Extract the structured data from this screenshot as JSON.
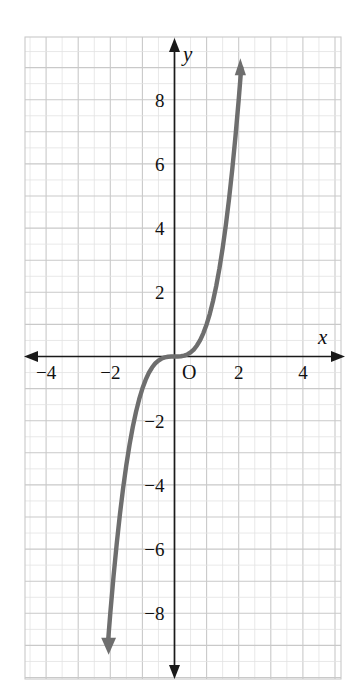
{
  "figure": {
    "background_color": "#ffffff",
    "grid_color": "#c9c9c9",
    "grid_minor_color": "#e2e2e2",
    "axis_color": "#1a1a1a",
    "curve_color": "#6e6e6e"
  },
  "chart_data": {
    "type": "line",
    "title": "",
    "subtitle": "",
    "xlabel": "x",
    "ylabel": "y",
    "function": "y = x^3",
    "xlim": [
      -4.65,
      5.3
    ],
    "ylim": [
      -9.95,
      10.05
    ],
    "xticks": [
      -4,
      -2,
      2,
      4
    ],
    "xtick_labels": [
      "−4",
      "−2",
      "2",
      "4"
    ],
    "yticks": [
      2,
      4,
      6,
      8,
      -2,
      -4,
      -6,
      -8
    ],
    "ytick_labels": [
      "2",
      "4",
      "6",
      "8",
      "−2",
      "−4",
      "−6",
      "−8"
    ],
    "origin_label": "O",
    "grid": true,
    "legend": false,
    "x": [
      -2.08,
      -2.0,
      -1.9,
      -1.8,
      -1.7,
      -1.6,
      -1.5,
      -1.4,
      -1.3,
      -1.2,
      -1.1,
      -1.0,
      -0.9,
      -0.8,
      -0.7,
      -0.6,
      -0.5,
      -0.4,
      -0.3,
      -0.2,
      -0.1,
      0.0,
      0.1,
      0.2,
      0.3,
      0.4,
      0.5,
      0.6,
      0.7,
      0.8,
      0.9,
      1.0,
      1.1,
      1.2,
      1.3,
      1.4,
      1.5,
      1.6,
      1.7,
      1.8,
      1.9,
      2.0,
      2.08
    ],
    "y": [
      -9.0,
      -8.0,
      -6.859,
      -5.832,
      -4.913,
      -4.096,
      -3.375,
      -2.744,
      -2.197,
      -1.728,
      -1.331,
      -1.0,
      -0.729,
      -0.512,
      -0.343,
      -0.216,
      -0.125,
      -0.064,
      -0.027,
      -0.008,
      -0.001,
      0.0,
      0.001,
      0.008,
      0.027,
      0.064,
      0.125,
      0.216,
      0.343,
      0.512,
      0.729,
      1.0,
      1.331,
      1.728,
      2.197,
      2.744,
      3.375,
      4.096,
      4.913,
      5.832,
      6.859,
      8.0,
      9.0
    ],
    "curve_endpoints": {
      "top": {
        "x": 2.08,
        "y": 9.0,
        "arrow": true
      },
      "bottom": {
        "x": -2.08,
        "y": -9.0,
        "arrow": true
      }
    },
    "axis_arrows": {
      "x_left": true,
      "x_right": true,
      "y_up": true,
      "y_down": true
    }
  }
}
